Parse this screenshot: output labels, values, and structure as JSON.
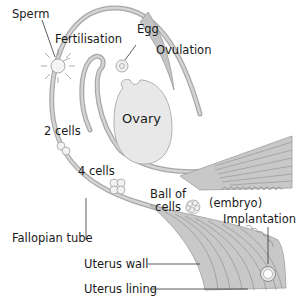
{
  "diagram": {
    "labels": {
      "sperm": "Sperm",
      "fertilisation": "Fertilisation",
      "egg": "Egg",
      "ovulation": "Ovulation",
      "ovary": "Ovary",
      "two_cells": "2 cells",
      "four_cells": "4 cells",
      "ball_of_cells_line1": "Ball of",
      "ball_of_cells_line2": "cells",
      "embryo": "(embryo)",
      "implantation": "Implantation",
      "fallopian_tube": "Fallopian tube",
      "uterus_wall": "Uterus wall",
      "uterus_lining": "Uterus lining"
    },
    "colors": {
      "tube_fill": "#c8c8c8",
      "tube_edge": "#9a9a9a",
      "ovary_fill": "#e8e8e8",
      "cell_fill": "#f2f2f2",
      "text": "#1a1a1a",
      "leader_line": "#333333"
    }
  }
}
